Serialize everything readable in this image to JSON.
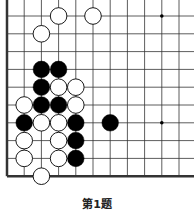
{
  "problem": {
    "caption": "第1题"
  },
  "board": {
    "origin_x": 7,
    "origin_y": 16,
    "col_spacing": 17.2,
    "row_spacing": 17.8,
    "cols": 11,
    "rows": 10,
    "left_edge": true,
    "bottom_edge": true,
    "stone_radius": 8.3,
    "colors": {
      "black": "#000000",
      "white": "#ffffff",
      "line": "#333333"
    },
    "star_points": [
      [
        9,
        0
      ],
      [
        9,
        6
      ]
    ],
    "stones": [
      {
        "color": "white",
        "col": 3,
        "row": 0
      },
      {
        "color": "white",
        "col": 5,
        "row": 0
      },
      {
        "color": "white",
        "col": 2,
        "row": 1
      },
      {
        "color": "black",
        "col": 2,
        "row": 3
      },
      {
        "color": "black",
        "col": 3,
        "row": 3
      },
      {
        "color": "black",
        "col": 2,
        "row": 4
      },
      {
        "color": "white",
        "col": 3,
        "row": 4
      },
      {
        "color": "white",
        "col": 4,
        "row": 4
      },
      {
        "color": "white",
        "col": 1,
        "row": 5
      },
      {
        "color": "black",
        "col": 2,
        "row": 5
      },
      {
        "color": "black",
        "col": 3,
        "row": 5
      },
      {
        "color": "white",
        "col": 4,
        "row": 5
      },
      {
        "color": "black",
        "col": 1,
        "row": 6
      },
      {
        "color": "white",
        "col": 2,
        "row": 6
      },
      {
        "color": "white",
        "col": 3,
        "row": 6
      },
      {
        "color": "black",
        "col": 4,
        "row": 6
      },
      {
        "color": "black",
        "col": 6,
        "row": 6
      },
      {
        "color": "white",
        "col": 1,
        "row": 7
      },
      {
        "color": "white",
        "col": 3,
        "row": 7
      },
      {
        "color": "black",
        "col": 4,
        "row": 7
      },
      {
        "color": "white",
        "col": 1,
        "row": 8
      },
      {
        "color": "white",
        "col": 3,
        "row": 8
      },
      {
        "color": "black",
        "col": 4,
        "row": 8
      },
      {
        "color": "white",
        "col": 2,
        "row": 9
      }
    ]
  }
}
